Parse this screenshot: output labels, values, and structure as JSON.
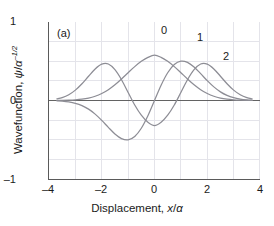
{
  "figure": {
    "panel_label": "(a)",
    "background": "#ffffff"
  },
  "axes": {
    "x": {
      "label_prefix": "Displacement, ",
      "label_var": "x",
      "label_div": "/",
      "label_unit": "α",
      "ticks": [
        "–4",
        "–2",
        "0",
        "2",
        "4"
      ],
      "tick_values": [
        -4,
        -2,
        0,
        2,
        4
      ],
      "range": [
        -4,
        4
      ]
    },
    "y": {
      "label_prefix": "Wavefunction, ",
      "label_var": "ψ",
      "label_div": "/",
      "label_unit": "α",
      "label_exp": "–1/2",
      "ticks": [
        "1",
        "0",
        "–1"
      ],
      "tick_values": [
        1,
        0,
        -1
      ],
      "range": [
        -1,
        1
      ]
    },
    "grid_color": "#e2e2e8",
    "axis_color": "#5a5a5a",
    "zero_line_color": "#606060"
  },
  "curve_labels": [
    {
      "text": "0",
      "x": 0.12,
      "y": 0.86
    },
    {
      "text": "1",
      "x": 1.45,
      "y": 0.78
    },
    {
      "text": "2",
      "x": 2.42,
      "y": 0.56
    }
  ],
  "chart_data": {
    "type": "line",
    "title": "",
    "subtitle": "(a)",
    "xlabel": "Displacement, x/α",
    "ylabel": "Wavefunction, ψ/α^–1/2",
    "xlim": [
      -4,
      4
    ],
    "ylim": [
      -1,
      1
    ],
    "grid": true,
    "grid_x_step": 1,
    "grid_y_step": 0.25,
    "legend": "inline curve labels",
    "line_color": "#8d8d95",
    "series": [
      {
        "name": "0",
        "label": "0",
        "quantum_number": 0,
        "description": "Ground state Gaussian, no nodes, peak 0.751 at x=0",
        "x": [
          -3.7,
          -3.5,
          -3.25,
          -3.0,
          -2.75,
          -2.5,
          -2.25,
          -2.0,
          -1.75,
          -1.5,
          -1.25,
          -1.0,
          -0.75,
          -0.5,
          -0.25,
          0,
          0.25,
          0.5,
          0.75,
          1.0,
          1.25,
          1.5,
          1.75,
          2.0,
          2.25,
          2.5,
          2.75,
          3.0,
          3.25,
          3.5,
          3.7
        ],
        "y": [
          0.0008,
          0.0016,
          0.0039,
          0.0084,
          0.0167,
          0.0311,
          0.0545,
          0.0895,
          0.1382,
          0.2007,
          0.2744,
          0.354,
          0.4318,
          0.4993,
          0.549,
          0.5767,
          0.549,
          0.4993,
          0.4318,
          0.354,
          0.2744,
          0.2007,
          0.1382,
          0.0895,
          0.0545,
          0.0311,
          0.0167,
          0.0084,
          0.0039,
          0.0016,
          0.0008
        ]
      },
      {
        "name": "1",
        "label": "1",
        "quantum_number": 1,
        "description": "First excited state, one node at x=0, peaks ±0.644 at x=±1",
        "x": [
          -3.7,
          -3.5,
          -3.25,
          -3.0,
          -2.75,
          -2.5,
          -2.25,
          -2.0,
          -1.75,
          -1.5,
          -1.25,
          -1.0,
          -0.75,
          -0.5,
          -0.25,
          0,
          0.25,
          0.5,
          0.75,
          1.0,
          1.25,
          1.5,
          1.75,
          2.0,
          2.25,
          2.5,
          2.75,
          3.0,
          3.25,
          3.5,
          3.7
        ],
        "y": [
          -0.0042,
          -0.008,
          -0.0179,
          -0.0357,
          -0.065,
          -0.11,
          -0.1734,
          -0.2531,
          -0.342,
          -0.4258,
          -0.4851,
          -0.5006,
          -0.4579,
          -0.3531,
          -0.1941,
          0,
          0.1941,
          0.3531,
          0.4579,
          0.5006,
          0.4851,
          0.4258,
          0.342,
          0.2531,
          0.1734,
          0.11,
          0.065,
          0.0357,
          0.0179,
          0.008,
          0.0042
        ]
      },
      {
        "name": "2",
        "label": "2",
        "quantum_number": 2,
        "description": "Second excited state, two nodes at x=±0.707, central minimum –0.54",
        "x": [
          -3.7,
          -3.5,
          -3.25,
          -3.0,
          -2.75,
          -2.5,
          -2.25,
          -2.0,
          -1.75,
          -1.5,
          -1.25,
          -1.0,
          -0.75,
          -0.5,
          -0.25,
          0,
          0.25,
          0.5,
          0.75,
          1.0,
          1.25,
          1.5,
          1.75,
          2.0,
          2.25,
          2.5,
          2.75,
          3.0,
          3.25,
          3.5,
          3.7
        ],
        "y": [
          0.0202,
          0.0362,
          0.0735,
          0.1322,
          0.2134,
          0.3094,
          0.402,
          0.4631,
          0.4645,
          0.3931,
          0.2643,
          0.1021,
          -0.0574,
          -0.1872,
          -0.2769,
          -0.3193,
          -0.2769,
          -0.1872,
          -0.0574,
          0.1021,
          0.2643,
          0.3931,
          0.4645,
          0.4631,
          0.402,
          0.3094,
          0.2134,
          0.1322,
          0.0735,
          0.0362,
          0.0202
        ]
      }
    ]
  }
}
